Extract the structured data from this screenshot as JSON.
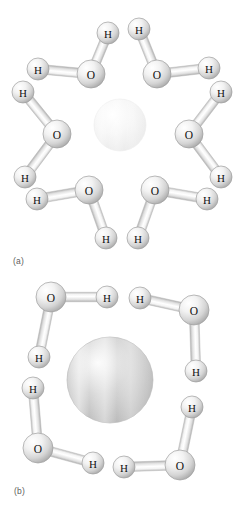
{
  "figure": {
    "background_color": "#ffffff",
    "atom_label_color": "#111111",
    "panels": [
      {
        "id": "a",
        "label": "(a)",
        "central_ion": {
          "name": "cation-sphere",
          "cx": 120,
          "cy": 125,
          "r": 26,
          "fill_light": "#ffffff",
          "fill_mid": "#f7f7f7",
          "fill_edge": "#e9e9e9"
        },
        "coordination_number": 6,
        "molecules": [
          {
            "name": "water-molecule-top-left",
            "oxygen": {
              "label": "O",
              "cx": 91,
              "cy": 74,
              "r": 14
            },
            "hydrogens": [
              {
                "label": "H",
                "cx": 108,
                "cy": 33,
                "r": 11
              },
              {
                "label": "H",
                "cx": 38,
                "cy": 69,
                "r": 11
              }
            ]
          },
          {
            "name": "water-molecule-top-right",
            "oxygen": {
              "label": "O",
              "cx": 157,
              "cy": 74,
              "r": 14
            },
            "hydrogens": [
              {
                "label": "H",
                "cx": 139,
                "cy": 29,
                "r": 11
              },
              {
                "label": "H",
                "cx": 209,
                "cy": 68,
                "r": 11
              }
            ]
          },
          {
            "name": "water-molecule-left",
            "oxygen": {
              "label": "O",
              "cx": 57,
              "cy": 134,
              "r": 14
            },
            "hydrogens": [
              {
                "label": "H",
                "cx": 23,
                "cy": 92,
                "r": 11
              },
              {
                "label": "H",
                "cx": 25,
                "cy": 177,
                "r": 11
              }
            ]
          },
          {
            "name": "water-molecule-right",
            "oxygen": {
              "label": "O",
              "cx": 189,
              "cy": 134,
              "r": 14
            },
            "hydrogens": [
              {
                "label": "H",
                "cx": 221,
                "cy": 92,
                "r": 11
              },
              {
                "label": "H",
                "cx": 221,
                "cy": 177,
                "r": 11
              }
            ]
          },
          {
            "name": "water-molecule-bottom-left",
            "oxygen": {
              "label": "O",
              "cx": 89,
              "cy": 190,
              "r": 14
            },
            "hydrogens": [
              {
                "label": "H",
                "cx": 37,
                "cy": 199,
                "r": 11
              },
              {
                "label": "H",
                "cx": 106,
                "cy": 238,
                "r": 11
              }
            ]
          },
          {
            "name": "water-molecule-bottom-right",
            "oxygen": {
              "label": "O",
              "cx": 155,
              "cy": 190,
              "r": 14
            },
            "hydrogens": [
              {
                "label": "H",
                "cx": 207,
                "cy": 199,
                "r": 11
              },
              {
                "label": "H",
                "cx": 138,
                "cy": 238,
                "r": 11
              }
            ]
          }
        ]
      },
      {
        "id": "b",
        "label": "(b)",
        "central_ion": {
          "name": "anion-sphere",
          "cx": 110,
          "cy": 125,
          "r": 43,
          "fill_light": "#fbfbfb",
          "fill_mid": "#d6d6d6",
          "fill_edge": "#b6b6b6"
        },
        "coordination_number": 4,
        "molecules": [
          {
            "name": "water-molecule-top-left",
            "oxygen": {
              "label": "O",
              "cx": 51,
              "cy": 42,
              "r": 15
            },
            "hydrogens": [
              {
                "label": "H",
                "cx": 107,
                "cy": 42,
                "r": 11
              },
              {
                "label": "H",
                "cx": 39,
                "cy": 102,
                "r": 11
              }
            ]
          },
          {
            "name": "water-molecule-top-right",
            "oxygen": {
              "label": "O",
              "cx": 194,
              "cy": 55,
              "r": 15
            },
            "hydrogens": [
              {
                "label": "H",
                "cx": 140,
                "cy": 43,
                "r": 11
              },
              {
                "label": "H",
                "cx": 196,
                "cy": 116,
                "r": 11
              }
            ]
          },
          {
            "name": "water-molecule-bottom-left",
            "oxygen": {
              "label": "O",
              "cx": 38,
              "cy": 193,
              "r": 15
            },
            "hydrogens": [
              {
                "label": "H",
                "cx": 33,
                "cy": 133,
                "r": 11
              },
              {
                "label": "H",
                "cx": 93,
                "cy": 208,
                "r": 11
              }
            ]
          },
          {
            "name": "water-molecule-bottom-right",
            "oxygen": {
              "label": "O",
              "cx": 180,
              "cy": 210,
              "r": 15
            },
            "hydrogens": [
              {
                "label": "H",
                "cx": 192,
                "cy": 152,
                "r": 11
              },
              {
                "label": "H",
                "cx": 124,
                "cy": 212,
                "r": 11
              }
            ]
          }
        ]
      }
    ]
  }
}
